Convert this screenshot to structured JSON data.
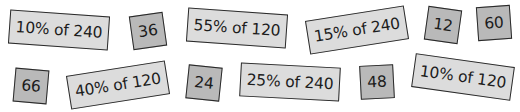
{
  "cards": [
    {
      "text": "10% of 240",
      "kind": "question"
    },
    {
      "text": "36",
      "kind": "answer"
    },
    {
      "text": "55% of 120",
      "kind": "question"
    },
    {
      "text": "15% of 240",
      "kind": "question"
    },
    {
      "text": "12",
      "kind": "answer"
    },
    {
      "text": "60",
      "kind": "answer"
    },
    {
      "text": "66",
      "kind": "answer"
    },
    {
      "text": "40% of 120",
      "kind": "question"
    },
    {
      "text": "24",
      "kind": "answer"
    },
    {
      "text": "25% of 240",
      "kind": "question"
    },
    {
      "text": "48",
      "kind": "answer"
    },
    {
      "text": "10% of 120",
      "kind": "question"
    }
  ],
  "colors": {
    "question_card": "#dcdcdc",
    "answer_card": "#b9b9b9",
    "border": "#2a2a2a",
    "text": "#1c1c1c"
  }
}
